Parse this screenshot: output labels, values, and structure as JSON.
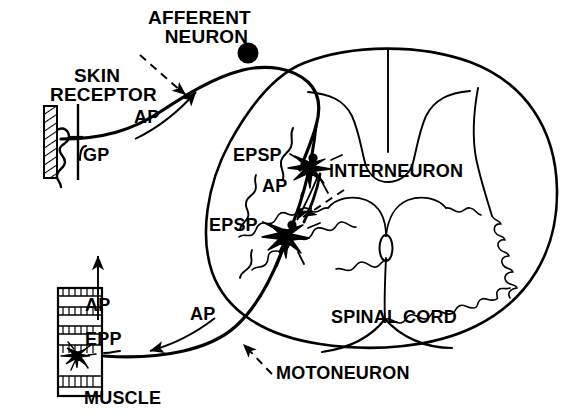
{
  "figure": {
    "type": "anatomical-schematic",
    "background_color": "#ffffff",
    "stroke_color": "#000000",
    "width": 588,
    "height": 419
  },
  "labels": {
    "skin_receptor_line1": "SKIN",
    "skin_receptor_line2": "RECEPTOR",
    "afferent_neuron_line1": "AFFERENT",
    "afferent_neuron_line2": "NEURON",
    "gp": "GP",
    "ap_afferent": "AP",
    "epsp_upper": "EPSP",
    "epsp_lower": "EPSP",
    "ap_interneuron": "AP",
    "interneuron": "INTERNEURON",
    "spinal_cord": "SPINAL CORD",
    "motoneuron": "MOTONEURON",
    "ap_motor": "AP",
    "ap_muscle": "AP",
    "epp": "EPP",
    "muscle": "MUSCLE"
  },
  "structures": [
    {
      "name": "skin-receptor",
      "description": "hatched vertical band with squiggly nerve ending"
    },
    {
      "name": "dorsal-root-ganglion",
      "description": "filled black circle on afferent fiber"
    },
    {
      "name": "interneuron-soma",
      "description": "filled black star-shaped cell body"
    },
    {
      "name": "motoneuron-soma",
      "description": "filled black star-shaped cell body"
    },
    {
      "name": "spinal-cord-outline",
      "description": "oval cross-section of cord"
    },
    {
      "name": "gray-matter",
      "description": "butterfly shaped gray matter with dorsal and ventral horns"
    },
    {
      "name": "central-canal",
      "description": "small oval at centre of gray matter"
    },
    {
      "name": "muscle",
      "description": "striated vertical band"
    },
    {
      "name": "motor-endplate",
      "description": "star burst terminal on muscle fibre"
    }
  ],
  "signal_traces": [
    {
      "name": "gp-trace",
      "label": "GP",
      "site": "skin receptor"
    },
    {
      "name": "epsp-trace-upper",
      "label": "EPSP",
      "site": "interneuron"
    },
    {
      "name": "epsp-trace-lower",
      "label": "EPSP",
      "site": "motoneuron"
    },
    {
      "name": "epp-trace",
      "label": "EPP",
      "site": "muscle endplate"
    }
  ]
}
